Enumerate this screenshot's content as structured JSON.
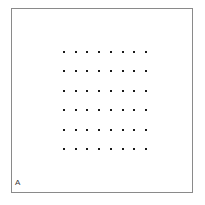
{
  "figure": {
    "width": 205,
    "height": 205,
    "background_color": "#ffffff"
  },
  "panel": {
    "label": "A",
    "label_color": "#3a3a3a",
    "label_font_size_px": 8,
    "label_left_px": 14,
    "label_top_px": 178,
    "frame": {
      "left_px": 11,
      "top_px": 8,
      "width_px": 182,
      "height_px": 185,
      "border_color": "#8a8a8a",
      "border_width_px": 1,
      "fill_color": "#ffffff"
    }
  },
  "chart_data": {
    "type": "scatter",
    "title": "",
    "subtitle": "",
    "xlabel": "",
    "ylabel": "",
    "annotations": [
      "A"
    ],
    "legend": [],
    "legend_position": "none",
    "grid": false,
    "axis_ticks_visible": false,
    "tick_labels_x": [],
    "tick_labels_y": [],
    "xlim": [
      0,
      7
    ],
    "ylim": [
      0,
      5
    ],
    "marker": {
      "shape": "square",
      "size_px": 2,
      "color": "#1a1a1a"
    },
    "n_rows": 6,
    "n_cols": 8,
    "n_points": 48,
    "series": [
      {
        "name": "dot-lattice",
        "color": "#1a1a1a",
        "x": [
          0,
          1,
          2,
          3,
          4,
          5,
          6,
          7,
          0,
          1,
          2,
          3,
          4,
          5,
          6,
          7,
          0,
          1,
          2,
          3,
          4,
          5,
          6,
          7,
          0,
          1,
          2,
          3,
          4,
          5,
          6,
          7,
          0,
          1,
          2,
          3,
          4,
          5,
          6,
          7,
          0,
          1,
          2,
          3,
          4,
          5,
          6,
          7
        ],
        "y": [
          5,
          5,
          5,
          5,
          5,
          5,
          5,
          5,
          4,
          4,
          4,
          4,
          4,
          4,
          4,
          4,
          3,
          3,
          3,
          3,
          3,
          3,
          3,
          3,
          2,
          2,
          2,
          2,
          2,
          2,
          2,
          2,
          1,
          1,
          1,
          1,
          1,
          1,
          1,
          1,
          0,
          0,
          0,
          0,
          0,
          0,
          0,
          0
        ]
      }
    ],
    "layout": {
      "grid_left_px": 57,
      "grid_top_px": 41,
      "grid_width_px": 94,
      "grid_height_px": 117,
      "col_spacing_px": 13.4,
      "row_spacing_px": 23.4
    }
  }
}
